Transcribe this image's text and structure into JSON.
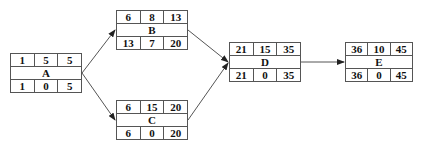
{
  "diagram": {
    "type": "activity-on-node network",
    "nodes": [
      {
        "id": "A",
        "label": "A",
        "es": "1",
        "dur": "5",
        "ef": "5",
        "ls": "1",
        "slack": "0",
        "lf": "5",
        "x": 10,
        "y": 53
      },
      {
        "id": "B",
        "label": "B",
        "es": "6",
        "dur": "8",
        "ef": "13",
        "ls": "13",
        "slack": "7",
        "lf": "20",
        "x": 116,
        "y": 10
      },
      {
        "id": "C",
        "label": "C",
        "es": "6",
        "dur": "15",
        "ef": "20",
        "ls": "6",
        "slack": "0",
        "lf": "20",
        "x": 116,
        "y": 100
      },
      {
        "id": "D",
        "label": "D",
        "es": "21",
        "dur": "15",
        "ef": "35",
        "ls": "21",
        "slack": "0",
        "lf": "35",
        "x": 229,
        "y": 42
      },
      {
        "id": "E",
        "label": "E",
        "es": "36",
        "dur": "10",
        "ef": "45",
        "ls": "36",
        "slack": "0",
        "lf": "45",
        "x": 345,
        "y": 42
      }
    ],
    "edges": [
      {
        "from": "A",
        "to": "B"
      },
      {
        "from": "A",
        "to": "C"
      },
      {
        "from": "B",
        "to": "D"
      },
      {
        "from": "C",
        "to": "D"
      },
      {
        "from": "D",
        "to": "E"
      }
    ],
    "colors": {
      "line": "#555555",
      "text": "#111111",
      "background": "#ffffff"
    }
  }
}
